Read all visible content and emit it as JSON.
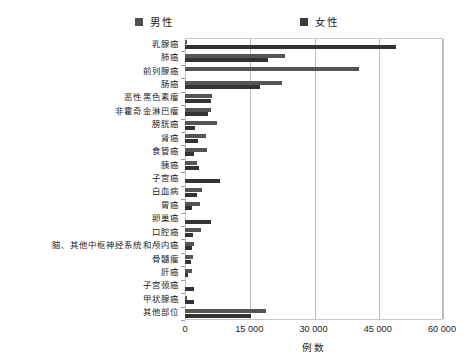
{
  "legend": {
    "male_label": "男性",
    "female_label": "女性",
    "male_color": "#4f4f4f",
    "female_color": "#333333"
  },
  "axis": {
    "x_title": "例数",
    "x_ticks": [
      "0",
      "15 000",
      "30 000",
      "45 000",
      "60 000"
    ]
  },
  "chart_data": {
    "type": "bar",
    "orientation": "horizontal",
    "title": "",
    "subtitle": "",
    "xlabel": "例数",
    "ylabel": "",
    "xlim": [
      0,
      60000
    ],
    "xticks": [
      0,
      15000,
      30000,
      45000,
      60000
    ],
    "grid": true,
    "legend_position": "top",
    "categories": [
      "乳腺癌",
      "肺癌",
      "前列腺癌",
      "肠癌",
      "恶性黑色素瘤",
      "非霍奇金淋巴瘤",
      "膀胱癌",
      "肾癌",
      "食管癌",
      "胰癌",
      "子宫癌",
      "白血病",
      "胃癌",
      "卵巢癌",
      "口腔癌",
      "脑、其他中枢神经系统和颅内癌",
      "骨髓瘤",
      "肝癌",
      "子宫颈癌",
      "甲状腺癌",
      "其他部位"
    ],
    "series": [
      {
        "name": "男性",
        "color": "#555555",
        "values": [
          400,
          23300,
          40600,
          22700,
          6350,
          6100,
          7500,
          4850,
          5050,
          2900,
          0,
          4050,
          3500,
          0,
          3700,
          2000,
          1800,
          1550,
          0,
          500,
          18900
        ]
      },
      {
        "name": "女性",
        "color": "#333333",
        "values": [
          49350,
          19300,
          0,
          17500,
          6000,
          5350,
          2300,
          3100,
          2200,
          3300,
          8100,
          2800,
          1550,
          6100,
          1800,
          1550,
          1400,
          600,
          2200,
          2000,
          15500
        ]
      }
    ]
  }
}
